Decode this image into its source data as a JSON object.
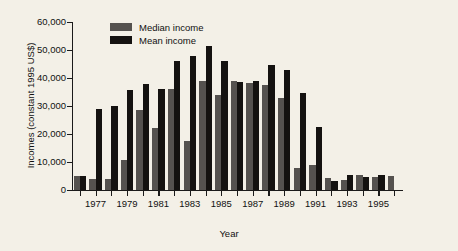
{
  "chart_data": {
    "type": "bar",
    "title": "",
    "xlabel": "Year",
    "ylabel": "Incomes (constant 1995 US$)",
    "ylim": [
      0,
      60000
    ],
    "ytick_labels": [
      "60,000",
      "50,000",
      "40,000",
      "30,000",
      "20,000",
      "10,000",
      "0"
    ],
    "ytick_values": [
      60000,
      50000,
      40000,
      30000,
      20000,
      10000,
      0
    ],
    "grid": false,
    "legend_position": "top-left-inside",
    "categories": [
      1976,
      1977,
      1978,
      1979,
      1980,
      1981,
      1982,
      1983,
      1984,
      1985,
      1986,
      1987,
      1988,
      1989,
      1990,
      1991,
      1992,
      1993,
      1994,
      1995,
      1996
    ],
    "xtick_labels_shown": [
      "1977",
      "1979",
      "1981",
      "1983",
      "1985",
      "1987",
      "1989",
      "1991",
      "1993",
      "1995"
    ],
    "series": [
      {
        "name": "Median income",
        "color": "#55524f",
        "values": [
          5000,
          4000,
          3900,
          10800,
          28700,
          22300,
          36200,
          17500,
          38900,
          34000,
          39000,
          38200,
          37400,
          32900,
          8000,
          8900,
          4200,
          3600,
          5200,
          4600,
          5100
        ]
      },
      {
        "name": "Mean income",
        "color": "#141210",
        "values": [
          5000,
          29000,
          29900,
          35800,
          37800,
          36100,
          46000,
          47700,
          51500,
          46200,
          38500,
          39000,
          44700,
          43000,
          34600,
          22400,
          3200,
          5500,
          4700,
          5300,
          0
        ]
      }
    ]
  },
  "legend": {
    "items": [
      {
        "label": "Median income",
        "swatch": "median"
      },
      {
        "label": "Mean income",
        "swatch": "mean"
      }
    ]
  }
}
